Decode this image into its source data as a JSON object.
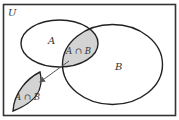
{
  "diagram": {
    "type": "venn",
    "universe_label": "U",
    "set_a_label": "A",
    "set_b_label": "B",
    "intersection_label": "A ∩ B",
    "extracted_label": "A ∩ B",
    "colors": {
      "stroke": "#222222",
      "shade": "#d3d3d3",
      "background": "#ffffff",
      "arrow": "#555555"
    }
  }
}
